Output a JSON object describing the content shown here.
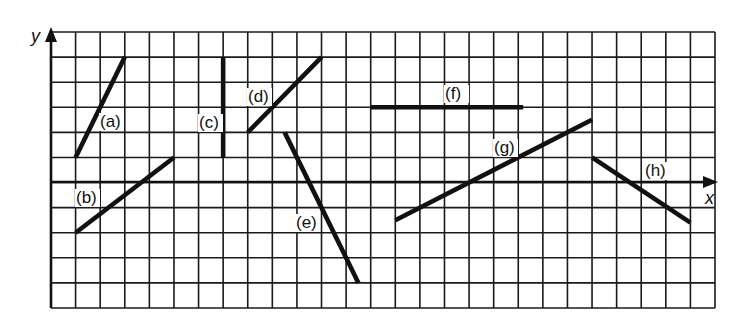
{
  "figure": {
    "axes": {
      "x_label": "x",
      "y_label": "y"
    },
    "grid": {
      "columns": 27,
      "rows": 11,
      "x_axis_row_from_top": 6
    },
    "segments": [
      {
        "id": "a",
        "label": "(a)",
        "from": [
          1,
          1
        ],
        "to": [
          3,
          5
        ]
      },
      {
        "id": "b",
        "label": "(b)",
        "from": [
          1,
          -2
        ],
        "to": [
          5,
          1
        ]
      },
      {
        "id": "c",
        "label": "(c)",
        "from": [
          7,
          1
        ],
        "to": [
          7,
          5
        ]
      },
      {
        "id": "d",
        "label": "(d)",
        "from": [
          8,
          2
        ],
        "to": [
          11,
          5
        ]
      },
      {
        "id": "e",
        "label": "(e)",
        "from": [
          9.5,
          2
        ],
        "to": [
          12.5,
          -4
        ]
      },
      {
        "id": "f",
        "label": "(f)",
        "from": [
          13,
          3
        ],
        "to": [
          19.2,
          3
        ]
      },
      {
        "id": "g",
        "label": "(g)",
        "from": [
          14,
          -1.5
        ],
        "to": [
          22,
          2.5
        ]
      },
      {
        "id": "h",
        "label": "(h)",
        "from": [
          22,
          1
        ],
        "to": [
          26,
          -1.6
        ]
      }
    ]
  }
}
